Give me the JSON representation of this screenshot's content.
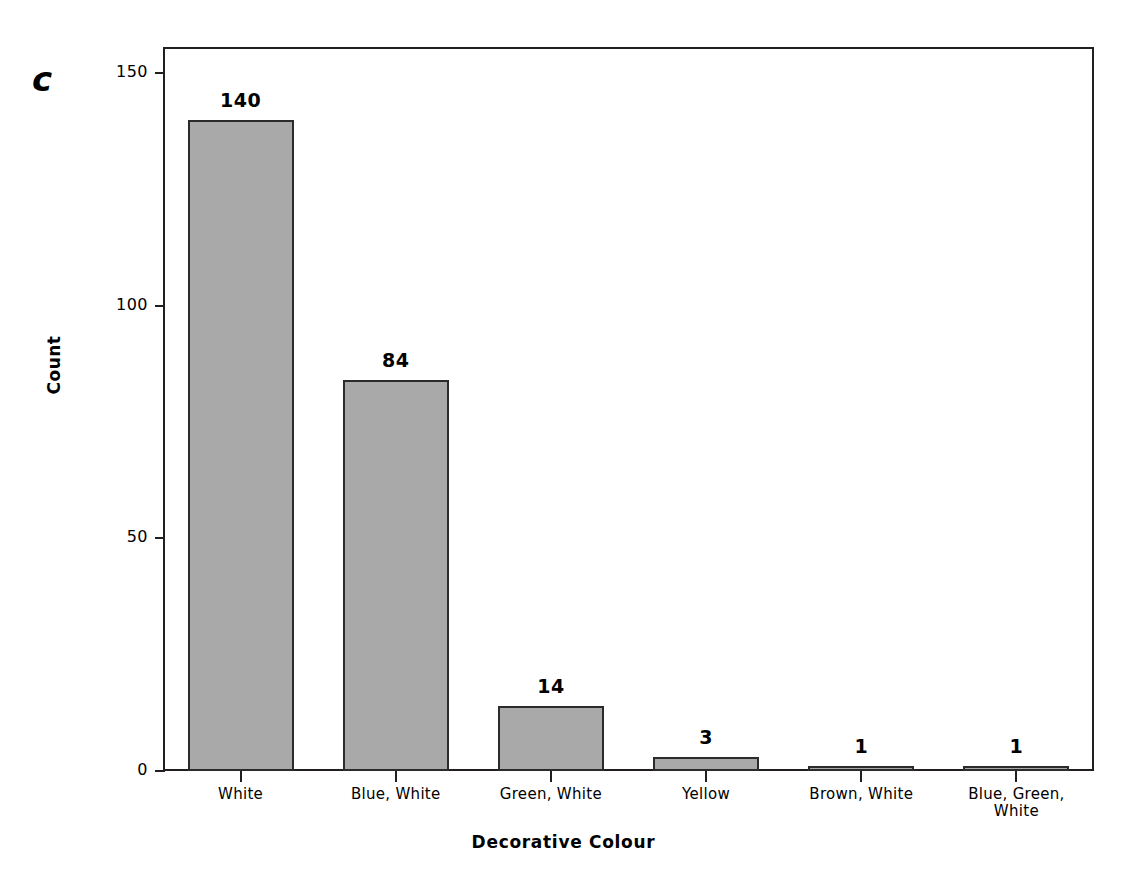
{
  "figure": {
    "panel_label": "c"
  },
  "chart_data": {
    "type": "bar",
    "title": "",
    "xlabel": "Decorative Colour",
    "ylabel": "Count",
    "categories": [
      "White",
      "Blue, White",
      "Green, White",
      "Yellow",
      "Brown, White",
      "Blue, Green, White"
    ],
    "category_lines": [
      [
        "White"
      ],
      [
        "Blue, White"
      ],
      [
        "Green, White"
      ],
      [
        "Yellow"
      ],
      [
        "Brown, White"
      ],
      [
        "Blue, Green,",
        "White"
      ]
    ],
    "values": [
      140,
      84,
      14,
      3,
      1,
      1
    ],
    "value_labels": [
      "140",
      "84",
      "14",
      "3",
      "1",
      "1"
    ],
    "ylim": [
      0,
      156
    ],
    "yticks": [
      0,
      50,
      100,
      150
    ],
    "ytick_labels": [
      "0",
      "50",
      "100",
      "150"
    ],
    "grid": false,
    "legend": null,
    "bar_color": "#a9a9a9",
    "bar_edge_color": "#2b2b2b",
    "axis_color": "#231f20"
  }
}
